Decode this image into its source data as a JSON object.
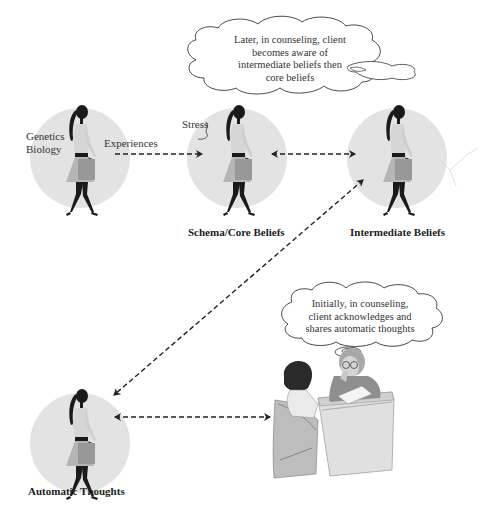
{
  "diagram": {
    "nodes": [
      {
        "id": "genetics",
        "lines": [
          "Genetics",
          "Biology"
        ],
        "caption": ""
      },
      {
        "id": "schema",
        "caption": "Schema/Core Beliefs",
        "side_label": "Stress"
      },
      {
        "id": "intermediate",
        "caption": "Intermediate Beliefs"
      },
      {
        "id": "automatic",
        "caption": "Automatic Thoughts"
      },
      {
        "id": "counseling",
        "caption": ""
      }
    ],
    "edges": [
      {
        "from": "genetics",
        "to": "schema",
        "label": "Experiences",
        "style": "dashed",
        "direction": "forward"
      },
      {
        "from": "schema",
        "to": "intermediate",
        "label": "",
        "style": "dashed",
        "direction": "both"
      },
      {
        "from": "intermediate",
        "to": "automatic",
        "label": "",
        "style": "dashed",
        "direction": "both"
      },
      {
        "from": "automatic",
        "to": "counseling",
        "label": "",
        "style": "dashed",
        "direction": "both"
      }
    ],
    "thought_bubbles": [
      {
        "id": "later",
        "lines": [
          "Later, in counseling, client",
          "becomes aware of",
          "intermediate beliefs then",
          "core beliefs"
        ]
      },
      {
        "id": "initially",
        "lines": [
          "Initially, in counseling,",
          "client acknowledges and",
          "shares automatic thoughts"
        ]
      }
    ]
  },
  "colors": {
    "circle_fill": "#e3e3e3",
    "figure_dark": "#1a1a1a",
    "figure_skirt": "#a9a9a9",
    "figure_top": "#d2d2d2",
    "arrow": "#222222"
  }
}
